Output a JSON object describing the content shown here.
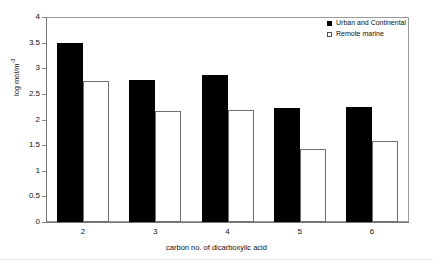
{
  "chart_data": {
    "type": "bar",
    "title": "",
    "subtitle": "",
    "xlabel": "carbon no. of dicarboxylic acid",
    "ylabel": "log mol/m",
    "ylabel_superscript": "-3",
    "categories": [
      "2",
      "3",
      "4",
      "5",
      "6"
    ],
    "series": [
      {
        "name": "Urban and Continental",
        "color": "#000000",
        "fill": "solid",
        "values": [
          3.5,
          2.77,
          2.87,
          2.22,
          2.25
        ]
      },
      {
        "name": "Remote marine",
        "color": "#ffffff",
        "fill": "open",
        "values": [
          2.75,
          2.16,
          2.18,
          1.43,
          1.58
        ]
      }
    ],
    "ylim": [
      0,
      4
    ],
    "ytick_step": 0.5,
    "yticks": [
      "4",
      "3.5",
      "3",
      "2.5",
      "2",
      "1.5",
      "1",
      "0.5",
      "0"
    ],
    "grid": false,
    "legend_position": "top-right",
    "plot_border": true
  },
  "legend": {
    "entries": [
      {
        "label": "Urban and Continental",
        "swatch": "filled-square-icon"
      },
      {
        "label": "Remote marine",
        "swatch": "open-square-icon"
      }
    ]
  },
  "axes": {
    "x_title": "carbon no. of dicarboxylic acid",
    "y_title_main": "log mol/m",
    "y_title_sup": "-3"
  }
}
